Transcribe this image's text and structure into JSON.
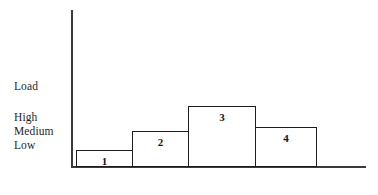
{
  "chart_data": {
    "type": "bar",
    "title": "",
    "xlabel": "",
    "ylabel": "Load",
    "grid": false,
    "legend": null,
    "y_tick_labels": [
      "High",
      "Medium",
      "Low"
    ],
    "categories": [
      "1",
      "2",
      "3",
      "4"
    ],
    "values": [
      1,
      2,
      4,
      3
    ],
    "value_labels": [
      "1",
      "2",
      "3",
      "4"
    ],
    "ylim": [
      0,
      5
    ]
  },
  "axis": {
    "y_label": "Load",
    "ticks": {
      "high": "High",
      "medium": "Medium",
      "low": "Low"
    }
  },
  "bars": [
    {
      "id": "bar-1",
      "label": "1"
    },
    {
      "id": "bar-2",
      "label": "2"
    },
    {
      "id": "bar-3",
      "label": "3"
    },
    {
      "id": "bar-4",
      "label": "4"
    }
  ],
  "colors": {
    "background": "#ffffff",
    "axis_line": "#3a3a3a",
    "bar_outline": "#1c1c1c",
    "bar_fill": "#ffffff",
    "text": "#1f1f1f"
  }
}
